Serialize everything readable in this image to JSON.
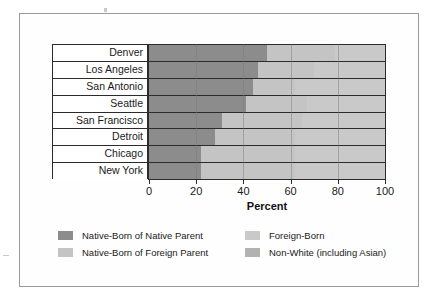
{
  "chart_data": {
    "type": "bar",
    "orientation": "horizontal",
    "stacked": true,
    "stack_mode": "percent",
    "title": "",
    "xlabel": "Percent",
    "ylabel": "",
    "xlim": [
      0,
      100
    ],
    "xticks": [
      0,
      20,
      40,
      60,
      80,
      100
    ],
    "xtick_labels": [
      "0",
      "20",
      "40",
      "60",
      "80",
      "100"
    ],
    "grid": "vertical",
    "legend_position": "bottom",
    "categories": [
      "Denver",
      "Los Angeles",
      "San Antonio",
      "Seattle",
      "San Francisco",
      "Detroit",
      "Chicago",
      "New York"
    ],
    "series": [
      {
        "name": "Native-Born of Native Parent",
        "color": "#8c8c8c",
        "values": [
          50,
          46,
          44,
          41,
          31,
          28,
          22,
          22
        ]
      },
      {
        "name": "Native-Born of Foreign Parent",
        "color": "#c4c4c4",
        "values": [
          29,
          24,
          18,
          26,
          34,
          34,
          40,
          40
        ]
      },
      {
        "name": "Foreign-Born",
        "color": "#c9c9c9",
        "values": [
          21,
          30,
          38,
          33,
          35,
          38,
          38,
          38
        ]
      },
      {
        "name": "Non-White (including Asian)",
        "color": "#b2b2b2",
        "values": [
          0,
          0,
          0,
          0,
          0,
          0,
          0,
          0
        ]
      }
    ],
    "cumulative_boundaries": [
      [
        50,
        79,
        100
      ],
      [
        46,
        70,
        100
      ],
      [
        44,
        62,
        100
      ],
      [
        41,
        67,
        100
      ],
      [
        31,
        65,
        100
      ],
      [
        28,
        62,
        100
      ],
      [
        22,
        62,
        100
      ],
      [
        22,
        62,
        100
      ]
    ]
  },
  "axis": {
    "title": "Percent",
    "ticks": [
      "0",
      "20",
      "40",
      "60",
      "80",
      "100"
    ]
  },
  "legend": {
    "items": [
      {
        "label": "Native-Born of Native Parent",
        "color": "#8c8c8c"
      },
      {
        "label": "Native-Born of Foreign Parent",
        "color": "#c4c4c4"
      },
      {
        "label": "Foreign-Born",
        "color": "#c9c9c9"
      },
      {
        "label": "Non-White (including Asian)",
        "color": "#b2b2b2"
      }
    ]
  },
  "colors": {
    "series_1": "#8c8c8c",
    "series_2": "#c4c4c4",
    "series_3": "#c9c9c9",
    "series_4": "#b2b2b2",
    "frame": "#9a9a9a",
    "axis": "#2b2b2b",
    "background": "#ffffff"
  }
}
